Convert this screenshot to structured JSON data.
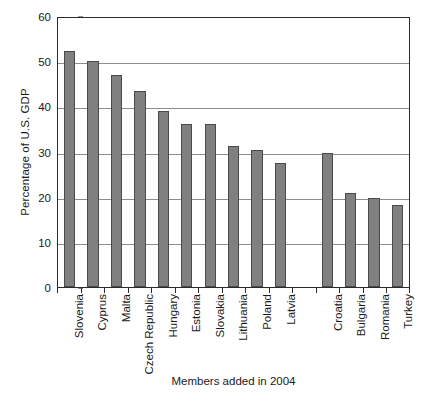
{
  "chart_data": {
    "type": "bar",
    "title": "",
    "xlabel": "Members added in 2004",
    "ylabel": "Percentage of U.S. GDP",
    "ylim": [
      0,
      60
    ],
    "yticks": [
      0,
      10,
      20,
      30,
      40,
      50,
      60
    ],
    "ytick_labels": [
      "0",
      "10",
      "20",
      "30",
      "40",
      "50",
      "60"
    ],
    "grid": "horizontal",
    "legend": "none",
    "bar_color": "#808080",
    "bar_edge_color": "#4a4a4a",
    "axis_color": "#2b2b2b",
    "gridline_color": "#8d8d8d",
    "background_color": "#ffffff",
    "categories": [
      "Slovenia",
      "Cyprus",
      "Malta",
      "Czech Republic",
      "Hungary",
      "Estonia",
      "Slovakia",
      "Lithuania",
      "Poland",
      "Latvia",
      "",
      "Croatia",
      "Bulgaria",
      "Romania",
      "Turkey"
    ],
    "values": [
      52.3,
      50.0,
      46.9,
      43.5,
      39.0,
      36.1,
      36.0,
      31.2,
      30.3,
      27.4,
      null,
      29.6,
      20.8,
      19.6,
      18.2
    ]
  }
}
